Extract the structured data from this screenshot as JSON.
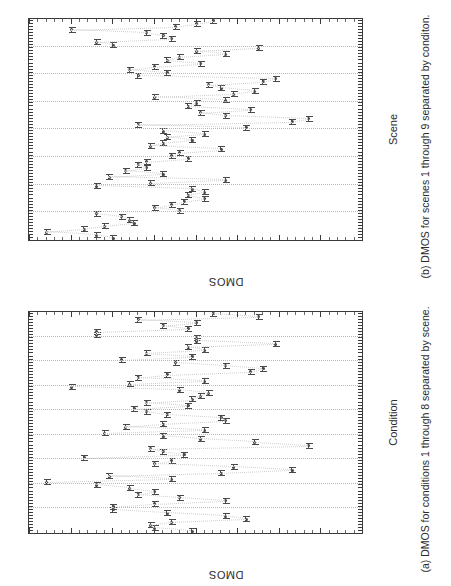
{
  "figure": {
    "orientation": "rotated-90-ccw",
    "ylabel": "DMOS",
    "yticks": [
      "0",
      "10",
      "20",
      "30",
      "40",
      "50",
      "60",
      "70",
      "80"
    ],
    "ylim": [
      0,
      80
    ]
  },
  "panel_a": {
    "caption": "(a) DMOS for conditions 1 through 8 separated by scene.",
    "xlabel": "Condition",
    "group_labels": [
      "Scene 1",
      "Scene 2",
      "Scene 3",
      "Scene 4",
      "Scene 5",
      "Scene 6",
      "Scene 7",
      "Scene 8",
      "Scene 9"
    ],
    "xtick_group_label": "12345678"
  },
  "panel_b": {
    "caption": "(b) DMOS for scenes 1 through 9 separated by conditon.",
    "xlabel": "Scene",
    "group_labels": [
      "Condition 1",
      "Condition 2",
      "Condition 3",
      "Condition 4",
      "Condition 5",
      "Condition 6",
      "Condition 7",
      "Condition 8"
    ],
    "xtick_group_label": "123456789"
  },
  "chart_data": [
    {
      "type": "scatter",
      "id": "panel-a",
      "title": "(a) DMOS for conditions 1 through 8 separated by scene.",
      "xlabel": "Condition",
      "ylabel": "DMOS",
      "ylim": [
        0,
        80
      ],
      "grid": false,
      "legend": "none",
      "group_axis": "scene",
      "groups": [
        {
          "name": "Scene 1",
          "x": [
            1,
            2,
            3,
            4,
            5,
            6,
            7,
            8
          ],
          "mean": [
            41,
            50,
            51,
            46,
            28,
            33,
            47,
            60
          ],
          "low": [
            36,
            45,
            46,
            40,
            24,
            29,
            42,
            55
          ],
          "high": [
            46,
            55,
            56,
            52,
            33,
            38,
            52,
            65
          ]
        },
        {
          "name": "Scene 2",
          "x": [
            1,
            2,
            3,
            4,
            5,
            6,
            7,
            8
          ],
          "mean": [
            60,
            50,
            33,
            44,
            54,
            50,
            56,
            64
          ],
          "low": [
            54,
            44,
            28,
            38,
            48,
            44,
            50,
            58
          ],
          "high": [
            66,
            56,
            38,
            50,
            60,
            56,
            62,
            70
          ]
        },
        {
          "name": "Scene 3",
          "x": [
            1,
            2,
            3,
            4,
            5,
            6,
            7,
            8
          ],
          "mean": [
            76,
            46,
            61,
            34,
            17,
            31,
            50,
            46
          ],
          "low": [
            70,
            41,
            55,
            28,
            12,
            25,
            44,
            40
          ],
          "high": [
            81,
            51,
            67,
            40,
            22,
            37,
            56,
            52
          ]
        },
        {
          "name": "Scene 4",
          "x": [
            1,
            2,
            3,
            4,
            5,
            6,
            7,
            8
          ],
          "mean": [
            67,
            43,
            48,
            51,
            13,
            26,
            39,
            48
          ],
          "low": [
            61,
            38,
            42,
            45,
            9,
            21,
            33,
            42
          ],
          "high": [
            73,
            48,
            54,
            57,
            18,
            31,
            45,
            54
          ]
        },
        {
          "name": "Scene 5",
          "x": [
            1,
            2,
            3,
            4,
            5,
            6,
            7,
            8
          ],
          "mean": [
            62,
            38,
            57,
            48,
            33,
            34,
            47,
            52
          ],
          "low": [
            56,
            33,
            51,
            42,
            28,
            29,
            41,
            46
          ],
          "high": [
            68,
            43,
            63,
            54,
            38,
            39,
            53,
            58
          ]
        },
        {
          "name": "Scene 6",
          "x": [
            1,
            2,
            3,
            4,
            5,
            6,
            7,
            8
          ],
          "mean": [
            55,
            42,
            52,
            41,
            39,
            37,
            44,
            70
          ],
          "low": [
            49,
            37,
            46,
            36,
            34,
            32,
            38,
            64
          ],
          "high": [
            61,
            47,
            58,
            46,
            44,
            42,
            50,
            76
          ]
        },
        {
          "name": "Scene 7",
          "x": [
            1,
            2,
            3,
            4,
            5,
            6,
            7,
            8
          ],
          "mean": [
            56,
            38,
            54,
            47,
            27,
            24,
            33,
            45
          ],
          "low": [
            50,
            33,
            48,
            41,
            22,
            19,
            27,
            39
          ],
          "high": [
            62,
            43,
            60,
            53,
            32,
            29,
            39,
            51
          ]
        },
        {
          "name": "Scene 8",
          "x": [
            1,
            2,
            3,
            4,
            5,
            6,
            7,
            8
          ],
          "mean": [
            58,
            41,
            52,
            38,
            42,
            21,
            40,
            40
          ],
          "low": [
            52,
            36,
            46,
            33,
            37,
            16,
            35,
            35
          ],
          "high": [
            64,
            46,
            58,
            43,
            47,
            26,
            45,
            45
          ]
        },
        {
          "name": "Scene 9",
          "x": [
            1,
            2,
            3,
            4,
            5,
            6,
            7,
            8
          ],
          "mean": [
            64,
            64,
            42,
            48,
            40,
            54,
            25,
            36
          ],
          "low": [
            58,
            59,
            37,
            42,
            34,
            49,
            20,
            30
          ],
          "high": [
            70,
            69,
            47,
            54,
            46,
            59,
            30,
            42
          ]
        }
      ]
    },
    {
      "type": "scatter",
      "id": "panel-b",
      "title": "(b) DMOS for scenes 1 through 9 separated by conditon.",
      "xlabel": "Scene",
      "ylabel": "DMOS",
      "ylim": [
        0,
        80
      ],
      "grid": false,
      "legend": "none",
      "group_axis": "condition",
      "groups": [
        {
          "name": "Condition 1",
          "x": [
            1,
            2,
            3,
            4,
            5,
            6,
            7,
            8,
            9
          ],
          "mean": [
            60,
            64,
            76,
            67,
            62,
            55,
            56,
            58,
            64
          ],
          "low": [
            55,
            58,
            71,
            61,
            56,
            50,
            50,
            52,
            58
          ],
          "high": [
            66,
            70,
            81,
            73,
            68,
            61,
            62,
            64,
            70
          ]
        },
        {
          "name": "Condition 2",
          "x": [
            1,
            2,
            3,
            4,
            5,
            6,
            7,
            8,
            9
          ],
          "mean": [
            44,
            50,
            46,
            43,
            38,
            42,
            38,
            41,
            64
          ],
          "low": [
            39,
            44,
            41,
            38,
            33,
            37,
            33,
            36,
            59
          ],
          "high": [
            49,
            56,
            51,
            49,
            43,
            47,
            43,
            46,
            69
          ]
        },
        {
          "name": "Condition 3",
          "x": [
            1,
            2,
            3,
            4,
            5,
            6,
            7,
            8,
            9
          ],
          "mean": [
            51,
            33,
            61,
            48,
            57,
            52,
            54,
            52,
            42
          ],
          "low": [
            46,
            28,
            55,
            42,
            51,
            46,
            48,
            46,
            37
          ],
          "high": [
            57,
            38,
            67,
            54,
            63,
            58,
            60,
            58,
            47
          ]
        },
        {
          "name": "Condition 4",
          "x": [
            1,
            2,
            3,
            4,
            5,
            6,
            7,
            8,
            9
          ],
          "mean": [
            46,
            44,
            34,
            51,
            48,
            41,
            47,
            38,
            48
          ],
          "low": [
            40,
            38,
            28,
            45,
            42,
            36,
            41,
            33,
            42
          ],
          " high": [],
          "high": [
            52,
            50,
            40,
            57,
            54,
            46,
            53,
            43,
            54
          ]
        },
        {
          "name": "Condition 5",
          "x": [
            1,
            2,
            3,
            4,
            5,
            6,
            7,
            8,
            9
          ],
          "mean": [
            28,
            54,
            17,
            13,
            33,
            39,
            27,
            42,
            40
          ],
          "low": [
            24,
            48,
            12,
            9,
            28,
            34,
            22,
            37,
            34
          ],
          "high": [
            33,
            60,
            22,
            18,
            38,
            44,
            32,
            47,
            46
          ]
        },
        {
          "name": "Condition 6",
          "x": [
            1,
            2,
            3,
            4,
            5,
            6,
            7,
            8,
            9
          ],
          "mean": [
            33,
            50,
            31,
            26,
            34,
            37,
            24,
            21,
            54
          ],
          "low": [
            29,
            44,
            25,
            21,
            29,
            32,
            19,
            16,
            49
          ],
          "high": [
            38,
            56,
            37,
            31,
            39,
            42,
            29,
            26,
            59
          ]
        },
        {
          "name": "Condition 7",
          "x": [
            1,
            2,
            3,
            4,
            5,
            6,
            7,
            8,
            9
          ],
          "mean": [
            47,
            56,
            50,
            39,
            47,
            44,
            33,
            40,
            25
          ],
          "low": [
            42,
            50,
            44,
            33,
            41,
            38,
            27,
            35,
            20
          ],
          "high": [
            52,
            62,
            56,
            45,
            53,
            50,
            39,
            45,
            30
          ]
        },
        {
          "name": "Condition 8",
          "x": [
            1,
            2,
            3,
            4,
            5,
            6,
            7,
            8,
            9
          ],
          "mean": [
            60,
            64,
            46,
            48,
            52,
            70,
            45,
            40,
            36
          ],
          "low": [
            55,
            58,
            40,
            42,
            46,
            64,
            39,
            35,
            30
          ],
          "high": [
            65,
            70,
            52,
            54,
            58,
            76,
            51,
            45,
            42
          ]
        }
      ]
    }
  ]
}
